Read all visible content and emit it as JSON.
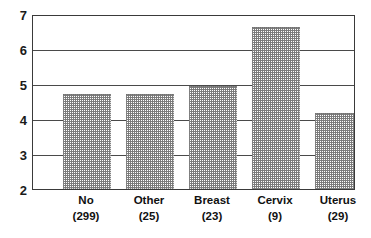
{
  "chart_data": {
    "type": "bar",
    "title": "",
    "subtitle": "",
    "xlabel": "",
    "ylabel": "",
    "categories": [
      "No",
      "Other",
      "Breast",
      "Cervix",
      "Uterus"
    ],
    "category_counts": [
      "(299)",
      "(25)",
      "(23)",
      "(9)",
      "(29)"
    ],
    "tick_labels_x": [
      "No (299)",
      "Other (25)",
      "Breast (23)",
      "Cervix (9)",
      "Uterus (29)"
    ],
    "values": [
      4.75,
      4.75,
      5.0,
      6.7,
      4.2
    ],
    "ylim": [
      2,
      7
    ],
    "yticks": [
      2,
      3,
      4,
      5,
      6,
      7
    ],
    "ytick_labels": [
      "2",
      "3",
      "4",
      "5",
      "6",
      "7"
    ],
    "grid": true,
    "grid_axis": "y",
    "legend": false,
    "legend_position": "none",
    "bar_fill": "#8c8c8c",
    "bar_fill_style": "dotted-stipple",
    "axis_color": "#3a3a3a",
    "gridline_color": "#4a4a4a",
    "background": "#ffffff",
    "series": [
      {
        "name": "value",
        "values": [
          4.75,
          4.75,
          5.0,
          6.7,
          4.2
        ]
      }
    ],
    "annotations": []
  },
  "axis": {
    "y_ticks": [
      {
        "label": "7",
        "value": 7
      },
      {
        "label": "6",
        "value": 6
      },
      {
        "label": "5",
        "value": 5
      },
      {
        "label": "4",
        "value": 4
      },
      {
        "label": "3",
        "value": 3
      },
      {
        "label": "2",
        "value": 2
      }
    ]
  },
  "bars": [
    {
      "label": "No",
      "count": "(299)",
      "value": 4.75
    },
    {
      "label": "Other",
      "count": "(25)",
      "value": 4.75
    },
    {
      "label": "Breast",
      "count": "(23)",
      "value": 5.0
    },
    {
      "label": "Cervix",
      "count": "(9)",
      "value": 6.7
    },
    {
      "label": "Uterus",
      "count": "(29)",
      "value": 4.2
    }
  ]
}
